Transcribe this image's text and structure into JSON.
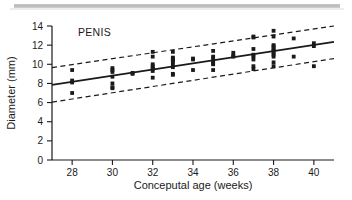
{
  "figure": {
    "artifact_bar": {
      "name": "scanner-gray-bar",
      "color": "#c2c2c2"
    },
    "background": "#ffffff",
    "ink_color": "#1a1a1a"
  },
  "chart_data": {
    "type": "scatter",
    "title": "PENIS",
    "xlabel": "Conceputal age (weeks)",
    "ylabel": "Diameter (mm)",
    "xlim": [
      27,
      41
    ],
    "ylim": [
      0,
      14
    ],
    "xticks": [
      28,
      30,
      32,
      34,
      36,
      38,
      40
    ],
    "yticks": [
      0,
      2,
      4,
      6,
      8,
      10,
      12,
      14
    ],
    "grid": false,
    "legend": null,
    "annotations": [
      {
        "text": "PENIS",
        "x": 28.2,
        "y": 13.6,
        "align": "left"
      }
    ],
    "lines": [
      {
        "name": "regression-line",
        "style": "solid",
        "x": [
          27,
          41
        ],
        "y": [
          7.85,
          12.35
        ],
        "equation_slope": 0.321,
        "equation_intercept": -0.82
      },
      {
        "name": "upper-prediction-band",
        "style": "dashed",
        "x": [
          27,
          41
        ],
        "y": [
          9.65,
          14.0
        ]
      },
      {
        "name": "lower-prediction-band",
        "style": "dashed",
        "x": [
          27,
          41
        ],
        "y": [
          6.05,
          10.6
        ]
      }
    ],
    "series": [
      {
        "name": "measurements",
        "marker": "square",
        "color": "#1a1a1a",
        "points": [
          [
            28.0,
            9.4
          ],
          [
            28.0,
            8.3
          ],
          [
            28.0,
            8.1
          ],
          [
            28.0,
            7.0
          ],
          [
            30.0,
            9.6
          ],
          [
            30.0,
            9.4
          ],
          [
            30.0,
            9.2
          ],
          [
            30.0,
            8.7
          ],
          [
            30.0,
            8.0
          ],
          [
            30.0,
            7.6
          ],
          [
            30.0,
            7.5
          ],
          [
            31.0,
            9.1
          ],
          [
            31.0,
            9.0
          ],
          [
            32.0,
            11.3
          ],
          [
            32.0,
            10.8
          ],
          [
            32.0,
            10.0
          ],
          [
            32.0,
            9.8
          ],
          [
            32.0,
            9.6
          ],
          [
            32.0,
            9.5
          ],
          [
            32.0,
            9.3
          ],
          [
            32.0,
            8.6
          ],
          [
            33.0,
            11.3
          ],
          [
            33.0,
            10.7
          ],
          [
            33.0,
            10.6
          ],
          [
            33.0,
            10.5
          ],
          [
            33.0,
            10.4
          ],
          [
            33.0,
            10.2
          ],
          [
            33.0,
            9.9
          ],
          [
            33.0,
            9.7
          ],
          [
            33.0,
            9.0
          ],
          [
            33.0,
            8.9
          ],
          [
            34.0,
            10.6
          ],
          [
            34.0,
            10.5
          ],
          [
            34.0,
            9.4
          ],
          [
            35.0,
            11.4
          ],
          [
            35.0,
            10.8
          ],
          [
            35.0,
            10.6
          ],
          [
            35.0,
            10.3
          ],
          [
            35.0,
            10.1
          ],
          [
            35.0,
            10.0
          ],
          [
            35.0,
            9.4
          ],
          [
            36.0,
            11.2
          ],
          [
            36.0,
            10.9
          ],
          [
            36.0,
            10.8
          ],
          [
            37.0,
            12.9
          ],
          [
            37.0,
            12.8
          ],
          [
            37.0,
            11.6
          ],
          [
            37.0,
            11.0
          ],
          [
            37.0,
            10.8
          ],
          [
            37.0,
            10.5
          ],
          [
            37.0,
            9.8
          ],
          [
            37.0,
            9.5
          ],
          [
            38.0,
            13.5
          ],
          [
            38.0,
            12.9
          ],
          [
            38.0,
            12.0
          ],
          [
            38.0,
            11.9
          ],
          [
            38.0,
            11.7
          ],
          [
            38.0,
            11.5
          ],
          [
            38.0,
            11.4
          ],
          [
            38.0,
            11.2
          ],
          [
            38.0,
            11.0
          ],
          [
            38.0,
            10.8
          ],
          [
            38.0,
            10.2
          ],
          [
            38.0,
            9.8
          ],
          [
            39.0,
            12.7
          ],
          [
            39.0,
            10.8
          ],
          [
            40.0,
            12.2
          ],
          [
            40.0,
            11.9
          ],
          [
            40.0,
            9.8
          ]
        ]
      }
    ]
  }
}
